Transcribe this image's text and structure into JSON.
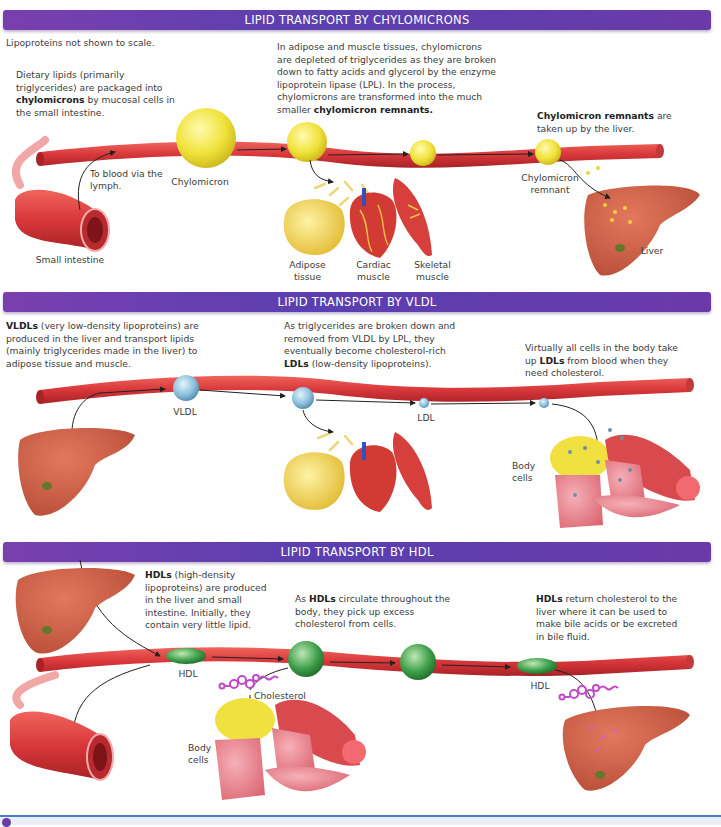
{
  "sections": [
    {
      "title": "LIPID TRANSPORT BY CHYLOMICRONS",
      "note": "Lipoproteins not shown to scale.",
      "text_blocks": [
        {
          "bold": "",
          "pre": "Dietary lipids (primarily triglycerides) are packaged into ",
          "strong": "chylomicrons",
          "post": " by mucosal cells in the small intestine."
        },
        {
          "pre": "In adipose and muscle tissues, chylomicrons are depleted of triglycerides as they are broken down to fatty acids and glycerol by the enzyme lipoprotein lipase (LPL). In the process, chylomicrons are transformed into the much smaller ",
          "strong": "chylomicron remnants.",
          "post": ""
        },
        {
          "pre": "",
          "strong": "Chylomicron remnants",
          "post": " are taken up by the liver."
        }
      ],
      "labels": {
        "to_blood": "To blood via the lymph.",
        "chylomicron": "Chylomicron",
        "small_intestine": "Small intestine",
        "adipose": "Adipose tissue",
        "cardiac": "Cardiac muscle",
        "skeletal": "Skeletal muscle",
        "remnant": "Chylomicron remnant",
        "liver": "Liver"
      }
    },
    {
      "title": "LIPID TRANSPORT BY VLDL",
      "text_blocks": [
        {
          "pre": "",
          "strong": "VLDLs",
          "post": " (very low-density lipoproteins) are produced in the liver and transport lipids (mainly triglycerides made in the liver) to adipose tissue and muscle."
        },
        {
          "pre": "As triglycerides are broken down and removed from VLDL by LPL, they eventually become cholesterol-rich ",
          "strong": "LDLs",
          "post": " (low-density lipoproteins)."
        },
        {
          "pre": "Virtually all cells in the body take up ",
          "strong": "LDLs",
          "post": " from blood when they need cholesterol."
        }
      ],
      "labels": {
        "vldl": "VLDL",
        "ldl": "LDL",
        "body_cells": "Body cells"
      }
    },
    {
      "title": "LIPID TRANSPORT BY HDL",
      "text_blocks": [
        {
          "pre": "",
          "strong": "HDLs",
          "post": " (high-density lipoproteins) are produced in the liver and small intestine. Initially, they contain very little lipid."
        },
        {
          "pre": "As ",
          "strong": "HDLs",
          "post": " circulate throughout the body, they pick up excess cholesterol from cells."
        },
        {
          "pre": "",
          "strong": "HDLs",
          "post": " return cholesterol to the liver where it can be used to make bile acids or be excreted in bile fluid."
        }
      ],
      "labels": {
        "hdl_left": "HDL",
        "cholesterol": "Cholesterol",
        "body_cells": "Body cells",
        "hdl_right": "HDL"
      }
    }
  ],
  "colors": {
    "banner": "#5a3fb0",
    "vessel": "#d8373a",
    "chylomicron": "#f0e23a",
    "vldl": "#8cc0dc",
    "hdl": "#3fa04a",
    "liver": "#c9563e",
    "cholesterol": "#c04ac8"
  }
}
